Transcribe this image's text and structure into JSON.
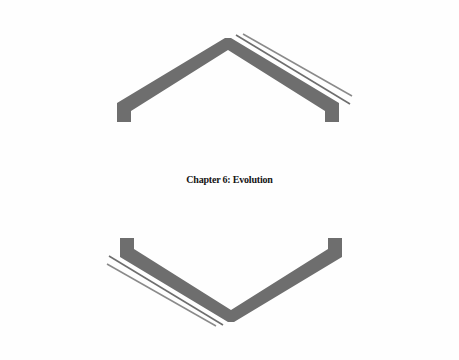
{
  "page": {
    "background_color": "#fefefe",
    "width": 459,
    "height": 360
  },
  "title": {
    "text": "Chapter 6: Evolution",
    "chapter_label": "Chapter",
    "chapter_number": "6",
    "chapter_name": "Evolution",
    "color": "#141414"
  },
  "ornaments": {
    "color": "#6e6e6e",
    "hairline_color": "#8a8a8a",
    "top": {
      "name": "chevron-up-ornament",
      "description": "upward chevron with end tabs and parallel hairlines to the upper right"
    },
    "bottom": {
      "name": "chevron-down-ornament",
      "description": "downward chevron with end tabs and parallel hairlines to the lower left"
    }
  }
}
